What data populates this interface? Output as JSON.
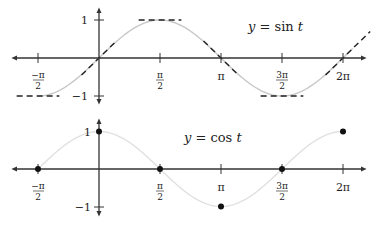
{
  "chart_data": [
    {
      "type": "line",
      "title": "y = sin t",
      "function": "sin",
      "x_ticks": [
        {
          "value": -1.5708,
          "label_num": "−π",
          "label_den": "2"
        },
        {
          "value": 1.5708,
          "label_num": "π",
          "label_den": "2"
        },
        {
          "value": 3.1416,
          "label": "π"
        },
        {
          "value": 4.7124,
          "label_num": "3π",
          "label_den": "2"
        },
        {
          "value": 6.2832,
          "label": "2π"
        }
      ],
      "y_ticks": [
        {
          "value": 1,
          "label": "1"
        },
        {
          "value": -1,
          "label": "−1"
        }
      ],
      "xlim": [
        -2.2,
        6.9
      ],
      "ylim": [
        -1.2,
        1.2
      ],
      "curve_color": "#c8c8c8",
      "annotation": "dashed tangent segments at t = −π/2, 0, π/2, π, 3π/2, 2π",
      "tangent_points": [
        {
          "t": -1.5708,
          "y": -1,
          "slope": 0
        },
        {
          "t": 0,
          "y": 0,
          "slope": 1
        },
        {
          "t": 1.5708,
          "y": 1,
          "slope": 0
        },
        {
          "t": 3.1416,
          "y": 0,
          "slope": -1
        },
        {
          "t": 4.7124,
          "y": -1,
          "slope": 0
        },
        {
          "t": 6.2832,
          "y": 0,
          "slope": 1
        }
      ]
    },
    {
      "type": "line",
      "title": "y = cos t",
      "function": "cos",
      "x_ticks": [
        {
          "value": -1.5708,
          "label_num": "−π",
          "label_den": "2"
        },
        {
          "value": 1.5708,
          "label_num": "π",
          "label_den": "2"
        },
        {
          "value": 3.1416,
          "label": "π"
        },
        {
          "value": 4.7124,
          "label_num": "3π",
          "label_den": "2"
        },
        {
          "value": 6.2832,
          "label": "2π"
        }
      ],
      "y_ticks": [
        {
          "value": 1,
          "label": "1"
        },
        {
          "value": -1,
          "label": "−1"
        }
      ],
      "xlim": [
        -2.2,
        6.9
      ],
      "ylim": [
        -1.2,
        1.2
      ],
      "curve_color": "#e0e0e0",
      "marked_points": [
        {
          "t": -1.5708,
          "y": 0
        },
        {
          "t": 0,
          "y": 1
        },
        {
          "t": 1.5708,
          "y": 0
        },
        {
          "t": 3.1416,
          "y": -1
        },
        {
          "t": 4.7124,
          "y": 0
        },
        {
          "t": 6.2832,
          "y": 1
        }
      ]
    }
  ],
  "labels": {
    "sin_title_y": "y",
    "sin_title_rest": " = sin ",
    "sin_title_t": "t",
    "cos_title_y": "y",
    "cos_title_rest": " = cos ",
    "cos_title_t": "t",
    "tick_neg_pi_half_num": "−π",
    "tick_neg_pi_half_den": "2",
    "tick_pi_half_num": "π",
    "tick_pi_half_den": "2",
    "tick_pi": "π",
    "tick_3pi_half_num": "3π",
    "tick_3pi_half_den": "2",
    "tick_2pi": "2π",
    "y_one": "1",
    "y_neg_one": "−1"
  }
}
